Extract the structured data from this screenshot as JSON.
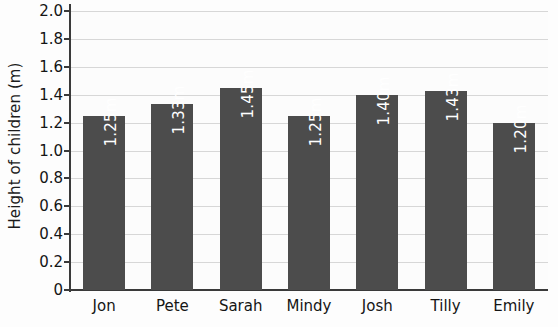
{
  "chart_data": {
    "type": "bar",
    "title": "",
    "xlabel": "",
    "ylabel": "Height of children (m)",
    "categories": [
      "Jon",
      "Pete",
      "Sarah",
      "Mindy",
      "Josh",
      "Tilly",
      "Emily"
    ],
    "values": [
      1.25,
      1.33,
      1.45,
      1.25,
      1.4,
      1.43,
      1.2
    ],
    "data_labels": [
      "1.25m",
      "1.33m",
      "1.45m",
      "1.25m",
      "1.40m",
      "1.43m",
      "1.20m"
    ],
    "ylim": [
      0,
      2.0
    ],
    "ytick_values": [
      0,
      0.2,
      0.4,
      0.6,
      0.8,
      1.0,
      1.2,
      1.4,
      1.6,
      1.8,
      2.0
    ],
    "ytick_labels": [
      "0",
      "0.2",
      "0.4",
      "0.6",
      "0.8",
      "1.0",
      "1.2",
      "1.4",
      "1.6",
      "1.8",
      "2.0"
    ],
    "grid": true,
    "legend": "none",
    "bar_color": "#4c4c4c",
    "gridline_color": "#d7d7d7",
    "axis_color": "#3a3a3a",
    "label_text_color": "#ffffff",
    "background_color": "#fcfcfc"
  }
}
